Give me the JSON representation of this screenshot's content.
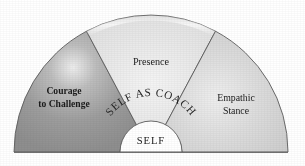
{
  "figure": {
    "title": "Self as Coach",
    "core_label": "SELF",
    "ring_label": "SELF AS COACH",
    "background_color": "#ffffff",
    "outline_color": "#5a5a5a"
  },
  "segments": [
    {
      "id": "courage-to-challenge",
      "label_line1": "Courage",
      "label_line2": "to Challenge",
      "fill_color": "#9a9a9a",
      "highlight_color": "#e8e8e8",
      "emphasis": "bold",
      "font_size": 9.6
    },
    {
      "id": "presence",
      "label_line1": "Presence",
      "label_line2": "",
      "fill_color": "#e3e3e3",
      "highlight_color": "#f3f3f3",
      "emphasis": "normal",
      "font_size": 10.2
    },
    {
      "id": "empathic-stance",
      "label_line1": "Empathic",
      "label_line2": "Stance",
      "fill_color": "#d4d4d4",
      "highlight_color": "#ededed",
      "emphasis": "normal",
      "font_size": 9.8
    }
  ]
}
